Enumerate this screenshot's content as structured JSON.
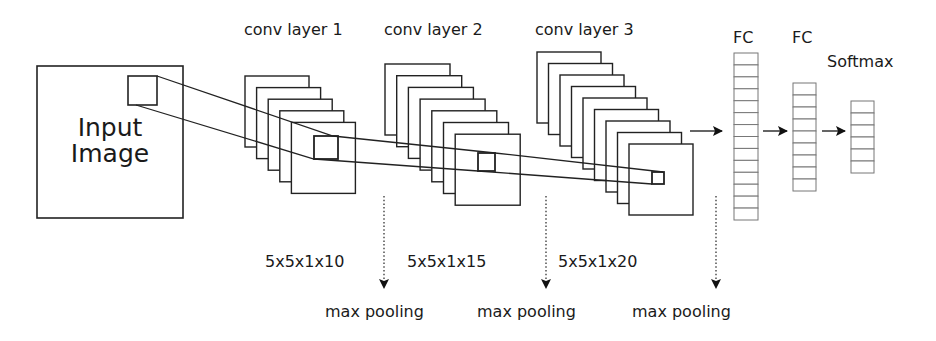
{
  "diagram": {
    "input": {
      "label_line1": "Input",
      "label_line2": "Image"
    },
    "conv_layers": [
      {
        "label": "conv layer 1",
        "kernel": "5x5x1x10",
        "feature_maps": 5,
        "pooling": "max pooling"
      },
      {
        "label": "conv layer 2",
        "kernel": "5x5x1x15",
        "feature_maps": 7,
        "pooling": "max pooling"
      },
      {
        "label": "conv layer 3",
        "kernel": "5x5x1x20",
        "feature_maps": 9,
        "pooling": "max pooling"
      }
    ],
    "dense_layers": [
      {
        "label": "FC",
        "units": 14
      },
      {
        "label": "FC",
        "units": 9
      },
      {
        "label": "Softmax",
        "units": 6
      }
    ],
    "colors": {
      "stroke": "#222222",
      "cell_stroke": "#777777",
      "text": "#1a1a1a",
      "background": "#ffffff"
    }
  }
}
